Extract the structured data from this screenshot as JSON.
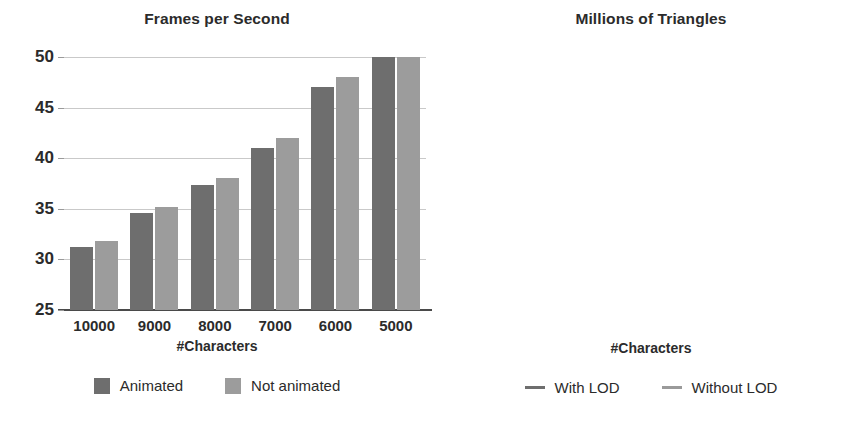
{
  "figure": {
    "width": 868,
    "height": 425,
    "background": "#ffffff"
  },
  "colors": {
    "series_dark": "#6e6e6e",
    "series_light": "#9c9c9c",
    "gridline": "#c9c9c9",
    "axis": "#4a4a4a",
    "text": "#2b2b2b"
  },
  "panels": [
    {
      "id": "frames-per-second",
      "title": "Frames per Second",
      "xlabel": "#Characters",
      "legend": [
        {
          "label": "Animated",
          "marker": "swatch",
          "color": "#6e6e6e"
        },
        {
          "label": "Not animated",
          "marker": "swatch",
          "color": "#9c9c9c"
        }
      ]
    },
    {
      "id": "millions-of-triangles",
      "title": "Millions of Triangles",
      "xlabel": "#Characters",
      "legend": [
        {
          "label": "With LOD",
          "marker": "solid-line",
          "color": "#6e6e6e"
        },
        {
          "label": "Without LOD",
          "marker": "dashed-line",
          "color": "#9c9c9c"
        }
      ]
    }
  ],
  "chart_data": [
    {
      "type": "bar",
      "title": "Frames per Second",
      "xlabel": "#Characters",
      "ylabel": "",
      "categories": [
        "10000",
        "9000",
        "8000",
        "7000",
        "6000",
        "5000"
      ],
      "yticks": [
        25,
        30,
        35,
        40,
        45,
        50
      ],
      "ylim": [
        25,
        50
      ],
      "grid": true,
      "legend_position": "bottom",
      "series": [
        {
          "name": "Animated",
          "color": "#6e6e6e",
          "values": [
            31.2,
            34.6,
            37.4,
            41.0,
            47.0,
            50.0
          ]
        },
        {
          "name": "Not animated",
          "color": "#9c9c9c",
          "values": [
            31.8,
            35.2,
            38.0,
            42.0,
            48.0,
            50.0
          ]
        }
      ]
    },
    {
      "type": "line",
      "title": "Millions of Triangles",
      "xlabel": "#Characters",
      "ylabel": "",
      "xticks": [
        "10000",
        "9000",
        "8000",
        "7000",
        "6000",
        "5000"
      ],
      "yticks": [
        0,
        10,
        20,
        30,
        40
      ],
      "ylim": [
        0,
        40
      ],
      "xlim": [
        10000,
        5000
      ],
      "grid": true,
      "legend_position": "bottom",
      "series": [
        {
          "name": "With LOD",
          "color": "#6e6e6e",
          "style": "solid",
          "x": [
            10000,
            9000,
            8000,
            7000,
            6000,
            5000
          ],
          "values": [
            4.3,
            4.0,
            3.7,
            3.4,
            3.2,
            3.0
          ]
        },
        {
          "name": "Without LOD",
          "color": "#9c9c9c",
          "style": "dashed",
          "x": [
            10000,
            9600,
            9200,
            8800,
            8500,
            8200,
            7800,
            7400,
            7000,
            6600,
            6200,
            5800,
            5400,
            5000
          ],
          "values": [
            34.8,
            34.2,
            33.6,
            32.6,
            31.0,
            29.0,
            27.0,
            26.6,
            26.2,
            25.6,
            24.6,
            24.0,
            22.4,
            21.0
          ]
        }
      ]
    }
  ]
}
